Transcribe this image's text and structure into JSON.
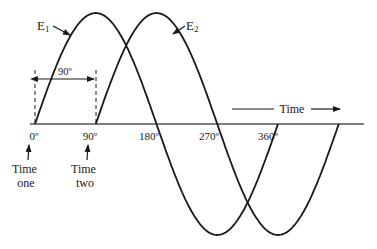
{
  "diagram": {
    "type": "phase-shifted sine waves",
    "waves": [
      {
        "label": "E",
        "subscript": "1",
        "phase_offset_deg": 0
      },
      {
        "label": "E",
        "subscript": "2",
        "phase_offset_deg": 90
      }
    ],
    "phase_difference_label": "90º",
    "axis_ticks": [
      "0º",
      "90º",
      "180º",
      "270º",
      "360º"
    ],
    "time_arrow_label": "Time",
    "markers": [
      {
        "line1": "Time",
        "line2": "one",
        "at": "0º"
      },
      {
        "line1": "Time",
        "line2": "two",
        "at": "90º"
      }
    ],
    "colors": {
      "stroke": "#1a1a1a",
      "axis": "#555555",
      "background": "#ffffff"
    }
  }
}
